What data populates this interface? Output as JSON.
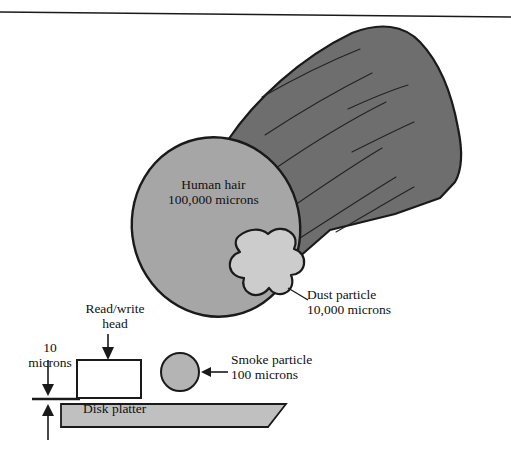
{
  "figure": {
    "colors": {
      "cylinder_body": "#6e6e6e",
      "cylinder_end_cap": "#a6a6a6",
      "dust_blob": "#cccccc",
      "smoke_particle": "#b4b4b4",
      "disk_platter": "#c0c0c0",
      "head_fill": "#ffffff",
      "outline": "#1a1a1a",
      "text": "#111111"
    },
    "top_rule": {
      "name": "top-horizontal-rule",
      "visible": true
    },
    "labels": {
      "human_hair": {
        "line1": "Human hair",
        "line2": "100,000 microns"
      },
      "dust_particle": {
        "line1": "Dust particle",
        "line2": "10,000 microns"
      },
      "smoke_particle": {
        "line1": "Smoke particle",
        "line2": "100 microns"
      },
      "read_write_head": {
        "line1": "Read/write",
        "line2": "head"
      },
      "gap": {
        "line1": "10",
        "line2": "microns"
      },
      "disk_platter": {
        "line1": "Disk platter"
      }
    },
    "measurements": {
      "human_hair_microns": "100,000",
      "dust_particle_microns": "10,000",
      "smoke_particle_microns": "100",
      "head_gap_microns": "10"
    }
  }
}
